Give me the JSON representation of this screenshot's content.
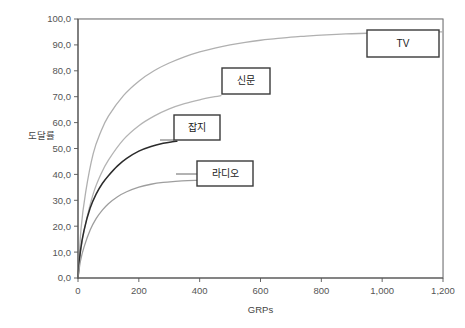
{
  "chart_data": {
    "type": "line",
    "title": "",
    "xlabel": "GRPs",
    "ylabel": "도달률",
    "xlim": [
      0,
      1200
    ],
    "ylim": [
      0,
      100
    ],
    "grid": true,
    "x_ticks": [
      "0",
      "200",
      "400",
      "600",
      "800",
      "1,000",
      "1,200"
    ],
    "x_tick_values": [
      0,
      200,
      400,
      600,
      800,
      1000,
      1200
    ],
    "y_ticks": [
      "0,0",
      "10,0",
      "20,0",
      "30,0",
      "40,0",
      "50,0",
      "60,0",
      "70,0",
      "80,0",
      "90,0",
      "100,0"
    ],
    "y_tick_values": [
      0,
      10,
      20,
      30,
      40,
      50,
      60,
      70,
      80,
      90,
      100
    ],
    "x_minor_step": 50,
    "y_minor_step": 5,
    "legend_position": "inline-callouts",
    "series": [
      {
        "name": "TV",
        "color": "#b0b0b0",
        "width": 1.3,
        "x": [
          0,
          10,
          25,
          50,
          75,
          100,
          150,
          200,
          250,
          300,
          350,
          400,
          450,
          500,
          550,
          600,
          650,
          700,
          750,
          800,
          850,
          900,
          950,
          1000,
          1050,
          1100,
          1150,
          1200
        ],
        "y": [
          0,
          19.0,
          33.0,
          48.0,
          56.5,
          62.5,
          70.5,
          76.0,
          80.0,
          83.0,
          85.4,
          87.3,
          88.8,
          90.0,
          91.0,
          91.8,
          92.4,
          93.0,
          93.4,
          93.8,
          94.1,
          94.3,
          94.5,
          94.7,
          94.8,
          94.9,
          95.0,
          95.0
        ]
      },
      {
        "name": "신문",
        "color": "#b4b4b4",
        "width": 1.3,
        "x": [
          0,
          10,
          25,
          50,
          75,
          100,
          150,
          200,
          250,
          300,
          350,
          400,
          450,
          470
        ],
        "y": [
          0,
          11.5,
          21.0,
          32.5,
          40.0,
          45.5,
          53.5,
          58.8,
          62.5,
          65.3,
          67.3,
          68.8,
          70.0,
          70.4
        ]
      },
      {
        "name": "잡지",
        "color": "#2b2b2b",
        "width": 1.5,
        "x": [
          0,
          8,
          20,
          40,
          60,
          80,
          100,
          130,
          160,
          200,
          240,
          280,
          310,
          325
        ],
        "y": [
          0,
          10.5,
          18.5,
          27.0,
          32.5,
          36.5,
          39.5,
          43.3,
          46.2,
          49.0,
          50.8,
          52.0,
          52.6,
          52.8
        ]
      },
      {
        "name": "라디오",
        "color": "#9e9e9e",
        "width": 1.3,
        "x": [
          0,
          8,
          20,
          40,
          60,
          80,
          100,
          130,
          160,
          200,
          240,
          280,
          320,
          360,
          390
        ],
        "y": [
          0,
          6.5,
          12.0,
          18.5,
          23.0,
          26.2,
          28.7,
          31.4,
          33.3,
          35.1,
          36.2,
          36.9,
          37.3,
          37.6,
          37.7
        ]
      }
    ],
    "callouts": [
      {
        "label": "TV",
        "box_x": 367,
        "box_y": 30,
        "box_w": 72,
        "box_h": 27,
        "leader_from_x": 367,
        "leader_from_y": 43,
        "leader_to_x": 367,
        "leader_to_y": 43
      },
      {
        "label": "신문",
        "box_x": 222,
        "box_y": 68,
        "box_w": 48,
        "box_h": 26,
        "leader_from_x": 222,
        "leader_from_y": 95,
        "leader_to_x": 222,
        "leader_to_y": 95
      },
      {
        "label": "잡지",
        "box_x": 174,
        "box_y": 115,
        "box_w": 46,
        "box_h": 25,
        "leader_from_x": 174,
        "leader_from_y": 140,
        "leader_to_x": 160,
        "leader_to_y": 140
      },
      {
        "label": "라디오",
        "box_x": 197,
        "box_y": 161,
        "box_w": 56,
        "box_h": 25,
        "leader_from_x": 197,
        "leader_from_y": 174,
        "leader_to_x": 176,
        "leader_to_y": 174
      }
    ]
  }
}
